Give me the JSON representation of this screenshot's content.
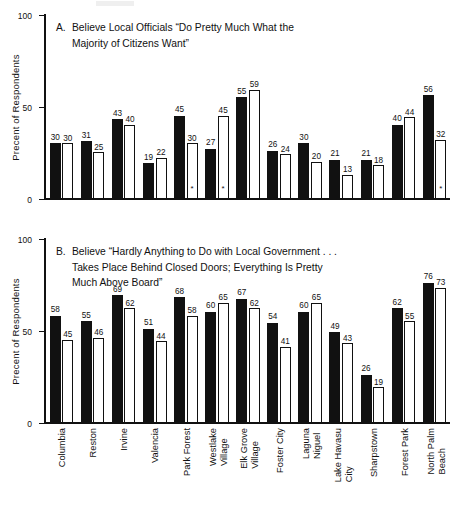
{
  "axis": {
    "ylabel": "Precent of Respondents",
    "yticks": [
      0,
      50,
      100
    ],
    "ymax": 100
  },
  "panelA": {
    "letter": "A.",
    "title_line1": "Believe Local Officials “Do Pretty Much What the",
    "title_line2": "Majority of Citizens Want”"
  },
  "panelB": {
    "letter": "B.",
    "title_line1": "Believe “Hardly Anything to Do with Local Government . . .",
    "title_line2": "Takes Place Behind Closed Doors; Everything Is Pretty",
    "title_line3": "Much Above Board”"
  },
  "categories": [
    {
      "l1": "Columbia",
      "l2": ""
    },
    {
      "l1": "Reston",
      "l2": ""
    },
    {
      "l1": "Irvine",
      "l2": ""
    },
    {
      "l1": "Valencia",
      "l2": ""
    },
    {
      "l1": "Park Forest",
      "l2": ""
    },
    {
      "l1": "Westlake",
      "l2": "Village"
    },
    {
      "l1": "Elk Grove",
      "l2": "Village"
    },
    {
      "l1": "Foster City",
      "l2": ""
    },
    {
      "l1": "Laguna",
      "l2": "Niguel"
    },
    {
      "l1": "Lake Havasu",
      "l2": "City"
    },
    {
      "l1": "Sharpstown",
      "l2": ""
    },
    {
      "l1": "Forest Park",
      "l2": ""
    },
    {
      "l1": "North Palm",
      "l2": "Beach"
    }
  ],
  "chart_data": [
    {
      "type": "bar",
      "title": "A. Believe Local Officials “Do Pretty Much What the Majority of Citizens Want”",
      "xlabel": "",
      "ylabel": "Precent of Respondents",
      "ylim": [
        0,
        100
      ],
      "yticks": [
        0,
        50,
        100
      ],
      "grid": false,
      "legend": "none",
      "categories": [
        "Columbia",
        "Reston",
        "Irvine",
        "Valencia",
        "Park Forest",
        "Westlake Village",
        "Elk Grove Village",
        "Foster City",
        "Laguna Niguel",
        "Lake Havasu City",
        "Sharpstown",
        "Forest Park",
        "North Palm Beach"
      ],
      "series": [
        {
          "name": "dark",
          "values": [
            30,
            31,
            43,
            19,
            45,
            27,
            55,
            26,
            30,
            21,
            21,
            40,
            56
          ]
        },
        {
          "name": "light",
          "values": [
            30,
            25,
            40,
            22,
            30,
            45,
            59,
            24,
            20,
            13,
            18,
            44,
            32
          ]
        }
      ],
      "annotations": [
        {
          "category": "Park Forest",
          "series": "light",
          "marker": "*"
        },
        {
          "category": "Westlake Village",
          "series": "light",
          "marker": "*"
        },
        {
          "category": "North Palm Beach",
          "series": "light",
          "marker": "*"
        }
      ]
    },
    {
      "type": "bar",
      "title": "B. Believe “Hardly Anything to Do with Local Government . . . Takes Place Behind Closed Doors; Everything Is Pretty Much Above Board”",
      "xlabel": "",
      "ylabel": "Precent of Respondents",
      "ylim": [
        0,
        100
      ],
      "yticks": [
        0,
        50,
        100
      ],
      "grid": false,
      "legend": "none",
      "categories": [
        "Columbia",
        "Reston",
        "Irvine",
        "Valencia",
        "Park Forest",
        "Westlake Village",
        "Elk Grove Village",
        "Foster City",
        "Laguna Niguel",
        "Lake Havasu City",
        "Sharpstown",
        "Forest Park",
        "North Palm Beach"
      ],
      "series": [
        {
          "name": "dark",
          "values": [
            58,
            55,
            69,
            51,
            68,
            60,
            67,
            54,
            60,
            49,
            26,
            62,
            76
          ]
        },
        {
          "name": "light",
          "values": [
            45,
            46,
            62,
            44,
            58,
            65,
            62,
            41,
            65,
            43,
            19,
            55,
            73
          ]
        }
      ],
      "annotations": []
    }
  ]
}
